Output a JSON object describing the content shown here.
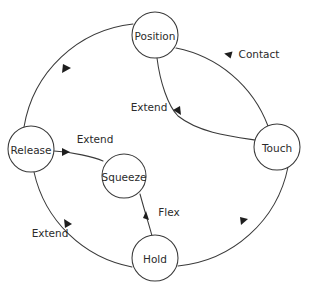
{
  "diagram": {
    "type": "state-transition-cycle",
    "background_color": "#ffffff",
    "stroke_color": "#3a3a3a",
    "text_color": "#2b2b2b",
    "nodes": [
      {
        "id": "position",
        "label": "Position",
        "cx": 155,
        "cy": 35,
        "r": 23
      },
      {
        "id": "touch",
        "label": "Touch",
        "cx": 277,
        "cy": 147,
        "r": 23
      },
      {
        "id": "hold",
        "label": "Hold",
        "cx": 155,
        "cy": 258,
        "r": 23
      },
      {
        "id": "release",
        "label": "Release",
        "cx": 31,
        "cy": 149,
        "r": 23
      },
      {
        "id": "squeeze",
        "label": "Squeeze",
        "cx": 124,
        "cy": 176,
        "r": 22
      }
    ],
    "edges": [
      {
        "id": "position-to-touch",
        "from": "Position",
        "to": "Touch",
        "label": "Contact",
        "label_x": 259,
        "label_y": 54
      },
      {
        "id": "touch-to-hold",
        "from": "Touch",
        "to": "Hold",
        "label": "",
        "label_x": 0,
        "label_y": 0
      },
      {
        "id": "hold-to-release",
        "from": "Hold",
        "to": "Release",
        "label": "Extend",
        "label_x": 50,
        "label_y": 233
      },
      {
        "id": "release-to-position",
        "from": "Release",
        "to": "Position",
        "label": "",
        "label_x": 0,
        "label_y": 0
      },
      {
        "id": "touch-to-position",
        "from": "Touch",
        "to": "Position",
        "label": "Extend",
        "label_x": 149,
        "label_y": 107
      },
      {
        "id": "hold-to-squeeze",
        "from": "Hold",
        "to": "Squeeze",
        "label": "Flex",
        "label_x": 169,
        "label_y": 212
      },
      {
        "id": "squeeze-to-release",
        "from": "Squeeze",
        "to": "Release",
        "label": "Extend",
        "label_x": 95,
        "label_y": 139
      }
    ]
  }
}
